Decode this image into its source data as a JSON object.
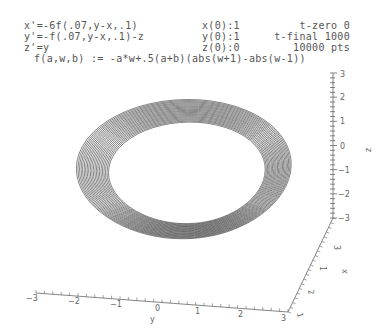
{
  "header": {
    "equations": [
      "x'=-6f(.07,y-x,.1)",
      "y'=-f(.07,y-x,.1)-z",
      "z'=y"
    ],
    "initial_conditions": [
      "x(0):1",
      "y(0):1",
      "z(0):0"
    ],
    "time_settings": [
      "t-zero 0",
      "t-final 1000",
      "10000 pts"
    ],
    "function_def": "f(a,w,b) := -a*w+.5(a+b)(abs(w+1)-abs(w-1))"
  },
  "chart_data": {
    "type": "line",
    "subtype": "3d-trajectory",
    "axes": {
      "x": {
        "label": "x",
        "ticks": [
          "3",
          "1",
          "2",
          "1"
        ]
      },
      "y": {
        "label": "y",
        "ticks": [
          "-3",
          "-2",
          "-1",
          "0",
          "1",
          "2",
          "3"
        ],
        "range": [
          -3,
          3
        ]
      },
      "z": {
        "label": "z",
        "ticks": [
          "3",
          "2",
          "1",
          "0",
          "-1",
          "-2",
          "-3"
        ],
        "range": [
          -3,
          3
        ]
      }
    },
    "params": {
      "t_zero": 0,
      "t_final": 1000,
      "points": 10000,
      "x0": 1,
      "y0": 1,
      "z0": 0
    },
    "line_color": "#333333"
  }
}
